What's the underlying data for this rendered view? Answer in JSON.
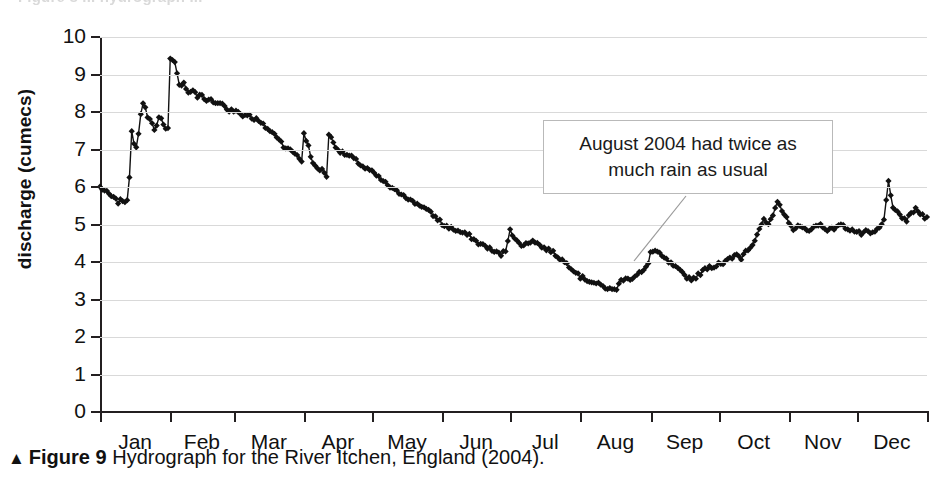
{
  "figure": {
    "caption_marker": "▲",
    "caption_label": "Figure 9",
    "caption_text": "Hydrograph for the River Itchen, England (2004).",
    "top_bleed_text": "Figure 8 ... hydrograph ..."
  },
  "annotation": {
    "line1": "August 2004 had twice as",
    "line2": "much rain as usual"
  },
  "colors": {
    "series": "#111111",
    "grid": "#d9d9d9",
    "axis": "#231f20",
    "callout_border": "#b9b9b9",
    "background": "#ffffff"
  },
  "chart_data": {
    "type": "line",
    "title": "",
    "xlabel": "",
    "ylabel": "discharge (cumecs)",
    "ylim": [
      0,
      10
    ],
    "yticks": [
      0,
      1,
      2,
      3,
      4,
      5,
      6,
      7,
      8,
      9,
      10
    ],
    "grid": true,
    "legend": "none",
    "marker": "diamond",
    "xlim_days": [
      0,
      365
    ],
    "categories": [
      "Jan",
      "Feb",
      "Mar",
      "Apr",
      "May",
      "Jun",
      "Jul",
      "Aug",
      "Sep",
      "Oct",
      "Nov",
      "Dec"
    ],
    "month_tick_days": [
      0,
      31,
      59,
      90,
      120,
      151,
      181,
      212,
      243,
      273,
      304,
      334,
      365
    ],
    "annotations": [
      {
        "text": "August 2004 had twice as much rain as usual",
        "box_x_day": 195,
        "box_y_value": 7.3,
        "points_to_day": 235,
        "points_to_value": 4.25
      }
    ],
    "series": [
      {
        "name": "River Itchen discharge",
        "units": "cumecs",
        "x": [
          0,
          2,
          4,
          6,
          8,
          10,
          12,
          13,
          14,
          15,
          16,
          17,
          18,
          19,
          20,
          21,
          22,
          23,
          24,
          25,
          26,
          27,
          28,
          29,
          30,
          31,
          33,
          35,
          37,
          39,
          41,
          43,
          45,
          47,
          49,
          51,
          53,
          55,
          57,
          58,
          59,
          61,
          63,
          65,
          67,
          69,
          71,
          73,
          75,
          77,
          79,
          81,
          83,
          85,
          87,
          89,
          90,
          92,
          94,
          96,
          98,
          99,
          100,
          101,
          103,
          105,
          107,
          109,
          111,
          113,
          115,
          117,
          119,
          120,
          122,
          124,
          126,
          128,
          130,
          132,
          134,
          136,
          138,
          140,
          142,
          144,
          146,
          148,
          150,
          151,
          153,
          155,
          157,
          159,
          161,
          163,
          165,
          167,
          169,
          171,
          173,
          175,
          177,
          179,
          181,
          183,
          185,
          187,
          189,
          191,
          193,
          195,
          197,
          199,
          201,
          203,
          205,
          207,
          209,
          211,
          212,
          214,
          216,
          218,
          220,
          222,
          224,
          226,
          228,
          230,
          232,
          234,
          236,
          238,
          240,
          242,
          243,
          245,
          247,
          249,
          251,
          253,
          255,
          257,
          259,
          261,
          263,
          265,
          267,
          269,
          271,
          273,
          275,
          277,
          279,
          281,
          283,
          285,
          287,
          289,
          291,
          293,
          295,
          297,
          299,
          301,
          303,
          304,
          306,
          308,
          310,
          312,
          314,
          316,
          318,
          320,
          322,
          324,
          326,
          328,
          330,
          332,
          334,
          336,
          338,
          340,
          342,
          344,
          346,
          348,
          350,
          352,
          354,
          356,
          358,
          360,
          362,
          364,
          365
        ],
        "y": [
          6.0,
          5.9,
          5.8,
          5.7,
          5.6,
          5.65,
          5.6,
          6.3,
          7.5,
          7.2,
          7.1,
          7.4,
          7.9,
          8.2,
          8.1,
          7.9,
          7.8,
          7.7,
          7.55,
          7.6,
          7.9,
          7.8,
          7.7,
          7.6,
          7.55,
          9.4,
          9.3,
          8.7,
          8.8,
          8.5,
          8.6,
          8.4,
          8.45,
          8.3,
          8.35,
          8.2,
          8.25,
          8.15,
          8.0,
          8.1,
          8.05,
          8.0,
          7.9,
          7.95,
          7.85,
          7.8,
          7.7,
          7.6,
          7.5,
          7.4,
          7.3,
          7.1,
          7.0,
          6.95,
          6.85,
          6.7,
          7.4,
          7.1,
          6.6,
          6.5,
          6.45,
          6.4,
          6.3,
          7.4,
          7.2,
          7.0,
          6.9,
          6.85,
          6.8,
          6.7,
          6.6,
          6.5,
          6.45,
          6.4,
          6.3,
          6.2,
          6.1,
          6.0,
          5.9,
          5.85,
          5.8,
          5.7,
          5.6,
          5.55,
          5.5,
          5.4,
          5.3,
          5.2,
          5.1,
          5.0,
          4.95,
          4.9,
          4.85,
          4.8,
          4.75,
          4.7,
          4.6,
          4.5,
          4.45,
          4.4,
          4.3,
          4.25,
          4.2,
          4.3,
          4.9,
          4.6,
          4.5,
          4.45,
          4.5,
          4.6,
          4.5,
          4.4,
          4.35,
          4.3,
          4.2,
          4.1,
          4.0,
          3.9,
          3.8,
          3.7,
          3.6,
          3.55,
          3.5,
          3.45,
          3.4,
          3.35,
          3.3,
          3.25,
          3.3,
          3.5,
          3.6,
          3.55,
          3.6,
          3.7,
          3.75,
          4.0,
          4.25,
          4.3,
          4.2,
          4.1,
          4.0,
          3.9,
          3.8,
          3.7,
          3.6,
          3.55,
          3.6,
          3.7,
          3.8,
          3.9,
          3.85,
          4.0,
          3.95,
          4.05,
          4.1,
          4.2,
          4.1,
          4.3,
          4.4,
          4.6,
          4.9,
          5.1,
          5.0,
          5.2,
          5.6,
          5.4,
          5.2,
          5.0,
          4.9,
          4.95,
          4.9,
          4.85,
          4.9,
          4.95,
          5.0,
          4.9,
          4.85,
          4.9,
          5.0,
          4.95,
          4.9,
          4.85,
          4.8,
          4.75,
          4.8,
          4.75,
          4.8,
          4.9,
          5.1,
          6.2,
          5.4,
          5.3,
          5.2,
          5.1,
          5.3,
          5.4,
          5.3,
          5.2,
          5.2
        ]
      }
    ]
  }
}
